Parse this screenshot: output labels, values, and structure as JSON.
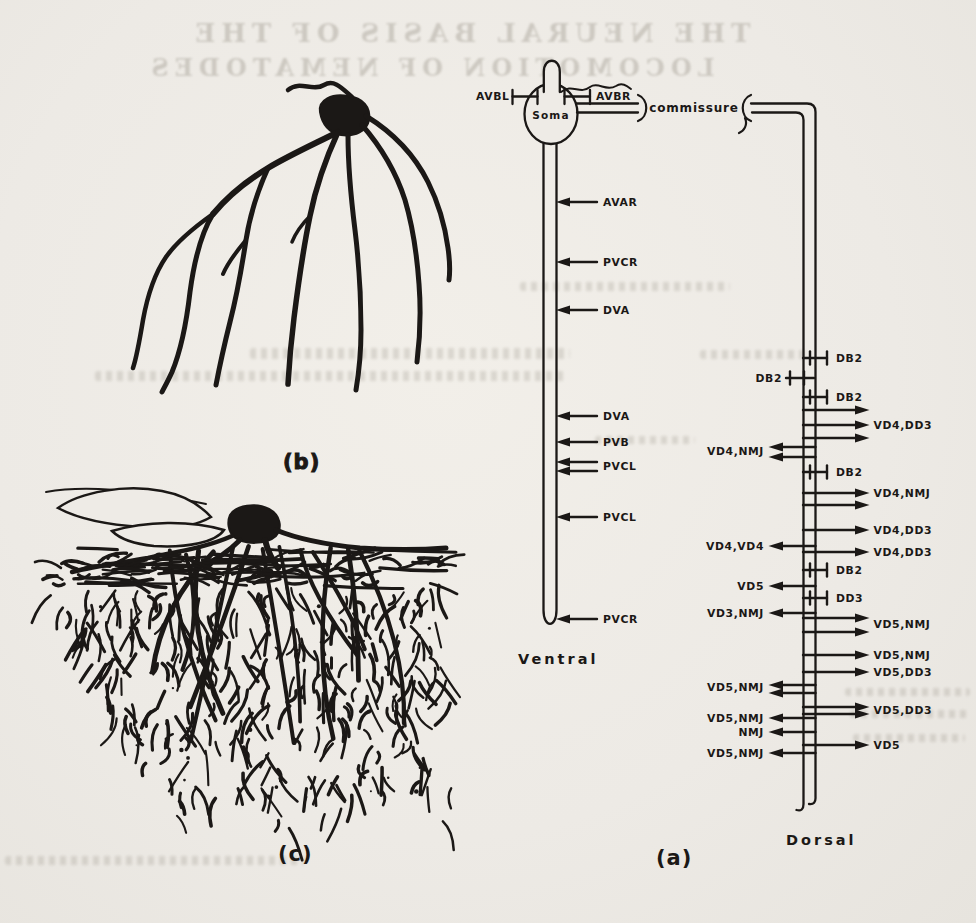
{
  "ghost": {
    "line1": "THE NEURAL BASIS OF THE",
    "line2": "LOCOMOTION OF NEMATODES"
  },
  "panels": {
    "a": {
      "label": "(a)"
    },
    "b": {
      "label": "(b)"
    },
    "c": {
      "label": "(c)"
    }
  },
  "diagram": {
    "soma_label": "Soma",
    "left_input_label": "AVBL",
    "right_input_label": "AVBR",
    "commissure_label": "commissure",
    "ventral_cord_label": "Ventral",
    "dorsal_cord_label": "Dorsal",
    "ventral_events": [
      {
        "label": "AVAR",
        "marks": [
          202
        ],
        "label_y": 206
      },
      {
        "label": "PVCR",
        "marks": [
          262
        ],
        "label_y": 266
      },
      {
        "label": "DVA",
        "marks": [
          310
        ],
        "label_y": 314
      },
      {
        "label": "DVA",
        "marks": [
          416
        ],
        "label_y": 420
      },
      {
        "label": "PVB",
        "marks": [
          442
        ],
        "label_y": 446
      },
      {
        "label": "PVCL",
        "marks": [
          462,
          471
        ],
        "label_y": 470
      },
      {
        "label": "PVCL",
        "marks": [
          517
        ],
        "label_y": 521
      },
      {
        "label": "PVCR",
        "marks": [
          619
        ],
        "label_y": 623
      }
    ],
    "dorsal_events": [
      {
        "label": "DB2",
        "side": "right",
        "kind": "tbar",
        "marks": [
          358
        ],
        "label_y": 362
      },
      {
        "label": "DB2",
        "side": "left",
        "kind": "tbar",
        "marks": [
          378
        ],
        "label_y": 382
      },
      {
        "label": "DB2",
        "side": "right",
        "kind": "tbar",
        "marks": [
          397
        ],
        "label_y": 401
      },
      {
        "label": "VD4,DD3",
        "side": "right",
        "kind": "arrow",
        "marks": [
          410,
          425,
          438
        ],
        "label_y": 429
      },
      {
        "label": "VD4,NMJ",
        "side": "left",
        "kind": "arrow",
        "marks": [
          447,
          457
        ],
        "label_y": 455
      },
      {
        "label": "DB2",
        "side": "right",
        "kind": "tbar",
        "marks": [
          472
        ],
        "label_y": 476
      },
      {
        "label": "VD4,NMJ",
        "side": "right",
        "kind": "arrow",
        "marks": [
          493,
          505
        ],
        "label_y": 497
      },
      {
        "label": "VD4,DD3",
        "side": "right",
        "kind": "arrow",
        "marks": [
          530
        ],
        "label_y": 534
      },
      {
        "label": "VD4,VD4",
        "side": "left",
        "kind": "arrow",
        "marks": [
          546
        ],
        "label_y": 550
      },
      {
        "label": "VD4,DD3",
        "side": "right",
        "kind": "arrow",
        "marks": [
          552
        ],
        "label_y": 556
      },
      {
        "label": "DB2",
        "side": "right",
        "kind": "tbar",
        "marks": [
          570
        ],
        "label_y": 574
      },
      {
        "label": "VD5",
        "side": "left",
        "kind": "arrow",
        "marks": [
          586
        ],
        "label_y": 590
      },
      {
        "label": "DD3",
        "side": "right",
        "kind": "tbar",
        "marks": [
          598
        ],
        "label_y": 602
      },
      {
        "label": "VD3,NMJ",
        "side": "left",
        "kind": "arrow",
        "marks": [
          613
        ],
        "label_y": 617
      },
      {
        "label": "VD5,NMJ",
        "side": "right",
        "kind": "arrow",
        "marks": [
          618,
          632
        ],
        "label_y": 628
      },
      {
        "label": "VD5,NMJ",
        "side": "right",
        "kind": "arrow",
        "marks": [
          655
        ],
        "label_y": 659
      },
      {
        "label": "VD5,DD3",
        "side": "right",
        "kind": "arrow",
        "marks": [
          672
        ],
        "label_y": 676
      },
      {
        "label": "VD5,NMJ",
        "side": "left",
        "kind": "arrow",
        "marks": [
          685,
          693
        ],
        "label_y": 691
      },
      {
        "label": "VD5,DD3",
        "side": "right",
        "kind": "arrow",
        "marks": [
          707,
          714
        ],
        "label_y": 714
      },
      {
        "label": "VD5,NMJ",
        "side": "left",
        "kind": "arrow",
        "marks": [
          718
        ],
        "label_y": 722
      },
      {
        "label": "NMJ",
        "side": "left",
        "kind": "arrow",
        "marks": [
          732
        ],
        "label_y": 736
      },
      {
        "label": "VD5",
        "side": "right",
        "kind": "arrow",
        "marks": [
          745
        ],
        "label_y": 749
      },
      {
        "label": "VD5,NMJ",
        "side": "left",
        "kind": "arrow",
        "marks": [
          753
        ],
        "label_y": 757
      }
    ]
  },
  "colors": {
    "ink": "#1b1816",
    "paper": "#eeebe6",
    "ghost": "#8d877c"
  }
}
